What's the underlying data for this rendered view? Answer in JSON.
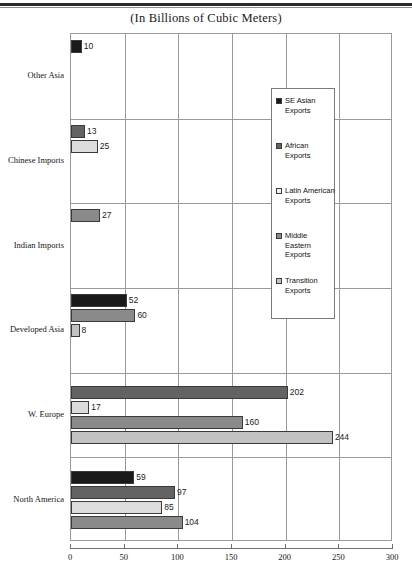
{
  "chart_data": {
    "type": "bar",
    "orientation": "horizontal",
    "title": "(In Billions of Cubic Meters)",
    "xlabel": "",
    "ylabel": "",
    "xlim": [
      0,
      300
    ],
    "xticks": [
      0,
      50,
      100,
      150,
      200,
      250,
      300
    ],
    "grid": true,
    "legend_position": "center-right",
    "categories": [
      "Other Asia",
      "Chinese Imports",
      "Indian Imports",
      "Developed Asia",
      "W. Europe",
      "North America"
    ],
    "series": [
      {
        "name": "SE Asian Exports",
        "color": "#1a1a1a",
        "values": [
          10,
          null,
          null,
          52,
          null,
          59
        ]
      },
      {
        "name": "African Exports",
        "color": "#636363",
        "values": [
          null,
          13,
          null,
          null,
          202,
          97
        ]
      },
      {
        "name": "Latin American Exports",
        "color": "#dcdcdc",
        "values": [
          null,
          25,
          null,
          null,
          17,
          85
        ]
      },
      {
        "name": "Middle Eastern Exports",
        "color": "#8a8a8a",
        "values": [
          null,
          null,
          27,
          60,
          160,
          104
        ]
      },
      {
        "name": "Transition Exports",
        "color": "#c2c2c2",
        "values": [
          null,
          null,
          null,
          8,
          244,
          null
        ]
      }
    ],
    "bars": [
      {
        "category": "Other Asia",
        "series": "SE Asian Exports",
        "value": 10,
        "label": "10"
      },
      {
        "category": "Chinese Imports",
        "series": "African Exports",
        "value": 13,
        "label": "13"
      },
      {
        "category": "Chinese Imports",
        "series": "Latin American Exports",
        "value": 25,
        "label": "25"
      },
      {
        "category": "Indian Imports",
        "series": "Middle Eastern Exports",
        "value": 27,
        "label": "27"
      },
      {
        "category": "Developed Asia",
        "series": "SE Asian Exports",
        "value": 52,
        "label": "52"
      },
      {
        "category": "Developed Asia",
        "series": "Middle Eastern Exports",
        "value": 60,
        "label": "60"
      },
      {
        "category": "Developed Asia",
        "series": "Transition Exports",
        "value": 8,
        "label": "8"
      },
      {
        "category": "W. Europe",
        "series": "African Exports",
        "value": 202,
        "label": "202"
      },
      {
        "category": "W. Europe",
        "series": "Latin American Exports",
        "value": 17,
        "label": "17"
      },
      {
        "category": "W. Europe",
        "series": "Middle Eastern Exports",
        "value": 160,
        "label": "160"
      },
      {
        "category": "W. Europe",
        "series": "Transition Exports",
        "value": 244,
        "label": "244"
      },
      {
        "category": "North America",
        "series": "SE Asian Exports",
        "value": 59,
        "label": "59"
      },
      {
        "category": "North America",
        "series": "African Exports",
        "value": 97,
        "label": "97"
      },
      {
        "category": "North America",
        "series": "Latin American Exports",
        "value": 85,
        "label": "85"
      },
      {
        "category": "North America",
        "series": "Middle Eastern Exports",
        "value": 104,
        "label": "104"
      }
    ]
  },
  "legend": {
    "entries": [
      {
        "label": "SE Asian Exports",
        "color": "#1a1a1a"
      },
      {
        "label": "African Exports",
        "color": "#636363"
      },
      {
        "label": "Latin American Exports",
        "color": "#f2f2f2"
      },
      {
        "label": "Middle Eastern Exports",
        "color": "#8a8a8a"
      },
      {
        "label": "Transition Exports",
        "color": "#c2c2c2"
      }
    ]
  },
  "axis": {
    "xticklabels": [
      "0",
      "50",
      "100",
      "150",
      "200",
      "250",
      "300"
    ]
  }
}
